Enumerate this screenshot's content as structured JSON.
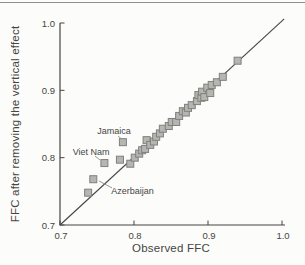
{
  "chart_data": {
    "type": "scatter",
    "title": "",
    "xlabel": "Observed FFC",
    "ylabel": "FFC after removing the vertical effect",
    "xlim": [
      0.7,
      1.0
    ],
    "ylim": [
      0.7,
      1.0
    ],
    "xticks": [
      "0.7",
      "0.8",
      "0.9",
      "1.0"
    ],
    "yticks": [
      "0.7",
      "0.8",
      "0.9",
      "1.0"
    ],
    "grid": false,
    "legend": false,
    "identity_line": {
      "x1": 0.7,
      "y1": 0.7,
      "x2": 1.003,
      "y2": 1.006
    },
    "marker_shape": "square",
    "colors": {
      "marker_fill": "#b5b5b1",
      "marker_stroke": "#80807c",
      "axis": "#454542",
      "text": "#454542",
      "leader_line": "#8f8f8b",
      "top_rule": "#8f8f8f",
      "background": "#fcfcfa"
    },
    "points": [
      [
        0.738,
        0.748
      ],
      [
        0.745,
        0.768
      ],
      [
        0.76,
        0.792
      ],
      [
        0.781,
        0.797
      ],
      [
        0.785,
        0.823
      ],
      [
        0.795,
        0.791
      ],
      [
        0.801,
        0.8
      ],
      [
        0.807,
        0.806
      ],
      [
        0.811,
        0.811
      ],
      [
        0.815,
        0.813
      ],
      [
        0.817,
        0.826
      ],
      [
        0.822,
        0.819
      ],
      [
        0.827,
        0.824
      ],
      [
        0.83,
        0.831
      ],
      [
        0.835,
        0.836
      ],
      [
        0.839,
        0.843
      ],
      [
        0.847,
        0.847
      ],
      [
        0.851,
        0.853
      ],
      [
        0.857,
        0.853
      ],
      [
        0.861,
        0.862
      ],
      [
        0.866,
        0.869
      ],
      [
        0.87,
        0.867
      ],
      [
        0.873,
        0.874
      ],
      [
        0.878,
        0.878
      ],
      [
        0.885,
        0.884
      ],
      [
        0.887,
        0.893
      ],
      [
        0.891,
        0.889
      ],
      [
        0.892,
        0.898
      ],
      [
        0.895,
        0.89
      ],
      [
        0.899,
        0.904
      ],
      [
        0.903,
        0.896
      ],
      [
        0.905,
        0.908
      ],
      [
        0.912,
        0.912
      ],
      [
        0.92,
        0.92
      ],
      [
        0.94,
        0.944
      ]
    ],
    "annotations": [
      {
        "label": "Jamaica",
        "point": [
          0.785,
          0.823
        ],
        "text_xy": [
          0.773,
          0.839
        ],
        "leader": [
          0.7784,
          0.8322,
          0.7824,
          0.8285
        ]
      },
      {
        "label": "Viet Nam",
        "point": [
          0.76,
          0.792
        ],
        "text_xy": [
          0.742,
          0.809
        ],
        "leader": [
          0.7473,
          0.8025,
          0.754,
          0.7966
        ]
      },
      {
        "label": "Azerbaijan",
        "point": [
          0.745,
          0.768
        ],
        "text_xy": [
          0.798,
          0.7505
        ],
        "leader": [
          0.7703,
          0.755,
          0.7527,
          0.7654
        ]
      }
    ]
  }
}
